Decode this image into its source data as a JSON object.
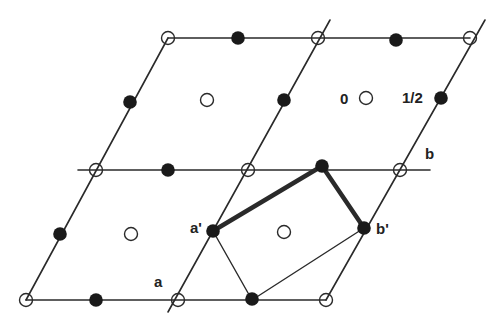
{
  "diagram": {
    "colors": {
      "line": "#2a2a2a",
      "filled": "#1a1a1a",
      "open_stroke": "#2a2a2a",
      "background": "#ffffff"
    },
    "labels": {
      "zero": "0",
      "half": "1/2",
      "a": "a",
      "b": "b",
      "a_prime": "a'",
      "b_prime": "b'"
    },
    "lines": [
      {
        "x1": 168,
        "y1": 38,
        "x2": 470,
        "y2": 38,
        "w": 1.6
      },
      {
        "x1": 78,
        "y1": 170,
        "x2": 430,
        "y2": 170,
        "w": 1.6
      },
      {
        "x1": 26,
        "y1": 300,
        "x2": 326,
        "y2": 300,
        "w": 1.6
      },
      {
        "x1": 26,
        "y1": 300,
        "x2": 168,
        "y2": 38,
        "w": 1.6
      },
      {
        "x1": 168,
        "y1": 312,
        "x2": 330,
        "y2": 20,
        "w": 1.6
      },
      {
        "x1": 326,
        "y1": 300,
        "x2": 485,
        "y2": 20,
        "w": 1.6
      },
      {
        "x1": 213,
        "y1": 231,
        "x2": 252,
        "y2": 300,
        "w": 1.4
      },
      {
        "x1": 252,
        "y1": 300,
        "x2": 364,
        "y2": 228,
        "w": 1.4
      },
      {
        "x1": 213,
        "y1": 231,
        "x2": 322,
        "y2": 166,
        "w": 4.5
      },
      {
        "x1": 322,
        "y1": 166,
        "x2": 364,
        "y2": 228,
        "w": 4.5
      }
    ],
    "open_points": [
      {
        "x": 168,
        "y": 38
      },
      {
        "x": 318,
        "y": 38
      },
      {
        "x": 470,
        "y": 38
      },
      {
        "x": 96,
        "y": 170
      },
      {
        "x": 248,
        "y": 170
      },
      {
        "x": 400,
        "y": 170
      },
      {
        "x": 26,
        "y": 300
      },
      {
        "x": 178,
        "y": 300
      },
      {
        "x": 326,
        "y": 300
      },
      {
        "x": 207,
        "y": 100
      },
      {
        "x": 366,
        "y": 98
      },
      {
        "x": 131,
        "y": 234
      },
      {
        "x": 284,
        "y": 232
      }
    ],
    "filled_points": [
      {
        "x": 238,
        "y": 38
      },
      {
        "x": 396,
        "y": 40
      },
      {
        "x": 168,
        "y": 170
      },
      {
        "x": 322,
        "y": 166
      },
      {
        "x": 96,
        "y": 300
      },
      {
        "x": 252,
        "y": 299
      },
      {
        "x": 130,
        "y": 102
      },
      {
        "x": 284,
        "y": 100
      },
      {
        "x": 441,
        "y": 98
      },
      {
        "x": 60,
        "y": 234
      },
      {
        "x": 213,
        "y": 231
      },
      {
        "x": 364,
        "y": 228
      }
    ],
    "text_positions": {
      "zero": {
        "x": 340,
        "y": 104
      },
      "half": {
        "x": 402,
        "y": 103
      },
      "a": {
        "x": 154,
        "y": 287
      },
      "b": {
        "x": 425,
        "y": 159
      },
      "a_prime": {
        "x": 190,
        "y": 233
      },
      "b_prime": {
        "x": 376,
        "y": 234
      }
    }
  }
}
